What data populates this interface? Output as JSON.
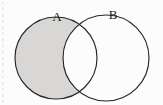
{
  "figure": {
    "type": "venn-diagram",
    "width": 163,
    "height": 105,
    "background_color": "#fcfcfc"
  },
  "colors": {
    "shading": "#d8d7d5",
    "outline": "#262626",
    "label_text": "#1a1a1a",
    "background": "#fcfcfc",
    "edge_marks": "#b9b9b9"
  },
  "sets": [
    {
      "id": "set-a",
      "label": "A",
      "label_x": 57,
      "label_y": 21,
      "center_x": 56,
      "center_y": 58,
      "radius": 41,
      "filled": true,
      "fill_color": "#d8d7d5"
    },
    {
      "id": "set-b",
      "label": "B",
      "label_x": 113,
      "label_y": 19,
      "center_x": 106,
      "center_y": 58,
      "radius": 43,
      "filled": false,
      "fill_color": "none"
    }
  ],
  "regions": [
    {
      "id": "region-a-only",
      "name": "A minus B",
      "shaded": true
    },
    {
      "id": "region-intersection",
      "name": "A intersect B",
      "shaded": false
    },
    {
      "id": "region-b-only",
      "name": "B minus A",
      "shaded": false
    }
  ],
  "edge_marks": {
    "present": true,
    "side": "left",
    "x": 2,
    "dash_count": 17
  }
}
